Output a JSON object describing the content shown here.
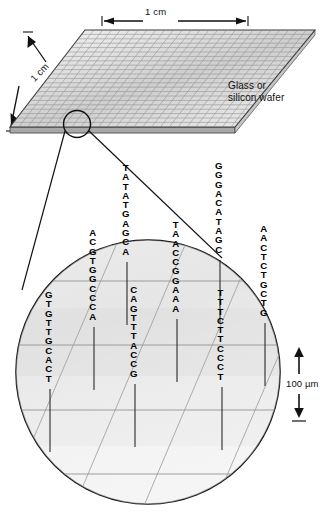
{
  "figure": {
    "title_absent": true
  },
  "wafer": {
    "caption": "Glass or silicon wafer",
    "dimension_top": "1 cm",
    "dimension_left": "1 cm",
    "grid_columns": 26,
    "grid_rows": 22,
    "colors": {
      "face_light": "#f2f2f2",
      "face_mid": "#d8d8d8",
      "face_dark": "#bdbdbd",
      "grid_line": "#8a8a8a",
      "edge": "#3a3a3a",
      "side": "#9a9a9a"
    }
  },
  "callout": {
    "circle_on_wafer": {
      "cx": 77,
      "cy": 124,
      "r": 13
    },
    "magnified_circle": {
      "cx": 148,
      "cy": 372,
      "r": 132
    }
  },
  "scale_bar": {
    "label": "100 µm",
    "arrow": "double-headed-vertical"
  },
  "probes": [
    {
      "id": "probe-1",
      "sequence": "GTGTTGCACT",
      "x": 50,
      "y": 290,
      "tether": 63
    },
    {
      "id": "probe-2",
      "sequence": "ACGTGGCCCA",
      "x": 94,
      "y": 228,
      "tether": 63
    },
    {
      "id": "probe-3",
      "sequence": "TATATGAGCA",
      "x": 127,
      "y": 163,
      "tether": 63
    },
    {
      "id": "probe-4",
      "sequence": "CAGTTTACCG",
      "x": 135,
      "y": 285,
      "tether": 63
    },
    {
      "id": "probe-5",
      "sequence": "TAACCGGAAA",
      "x": 177,
      "y": 220,
      "tether": 63
    },
    {
      "id": "probe-6",
      "sequence": "GGGACATAGC",
      "x": 220,
      "y": 161,
      "tether": 63
    },
    {
      "id": "probe-7",
      "sequence": "TTTCTTCCCT",
      "x": 222,
      "y": 288,
      "tether": 63
    },
    {
      "id": "probe-8",
      "sequence": "AACTCTGCTG",
      "x": 265,
      "y": 224,
      "tether": 63
    }
  ],
  "chart_data": {
    "type": "diagram",
    "elements": [
      "wafer substrate with printed spot grid",
      "magnification callout circle",
      "oligonucleotide probe sequences tethered to surface",
      "100 micrometre spot scale bar"
    ],
    "sequences": [
      "GTGTTGCACT",
      "ACGTGGCCCA",
      "TATATGAGCA",
      "CAGTTTACCG",
      "TAACCGGAAA",
      "GGGACATAGC",
      "TTTCTTCCCT",
      "AACTCTGCTG"
    ],
    "sequence_length": 10,
    "annotations": [
      "1 cm",
      "1 cm",
      "Glass or silicon wafer",
      "100 µm"
    ]
  }
}
